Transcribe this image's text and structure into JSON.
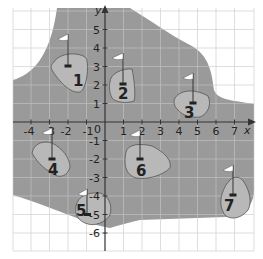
{
  "diagram": {
    "type": "coordinate-grid-golf-course",
    "axes": {
      "x_label": "x",
      "y_label": "y",
      "origin_label": "0",
      "x_ticks": [
        "-4",
        "-3",
        "-2",
        "-1",
        "1",
        "2",
        "3",
        "4",
        "5",
        "6",
        "7"
      ],
      "y_ticks": [
        "5",
        "4",
        "3",
        "2",
        "1",
        "-1",
        "-2",
        "-3",
        "-4",
        "-5",
        "-6"
      ],
      "x_range": [
        -5,
        8
      ],
      "y_range": [
        -7,
        6
      ]
    },
    "colors": {
      "fairway": "#9a9a9a",
      "green": "#b8b8b8",
      "grid_on_white": "#d8d8d8",
      "grid_on_gray": "#b0b0b0",
      "axis": "#333333",
      "flag": "#ffffff"
    },
    "holes": [
      {
        "label": "1",
        "hole": [
          -2,
          3
        ]
      },
      {
        "label": "2",
        "hole": [
          1,
          2
        ]
      },
      {
        "label": "3",
        "hole": [
          4.75,
          1
        ]
      },
      {
        "label": "4",
        "hole": [
          -3,
          -2
        ]
      },
      {
        "label": "5",
        "hole": [
          -1,
          -5
        ]
      },
      {
        "label": "6",
        "hole": [
          2,
          -2
        ]
      },
      {
        "label": "7",
        "hole": [
          7,
          -4
        ]
      }
    ]
  }
}
